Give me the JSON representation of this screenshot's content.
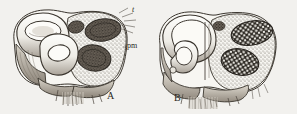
{
  "figure": {
    "type": "scientific-illustration",
    "background_color": "#f2f1ee",
    "ink_color": "#2b2722",
    "panels": [
      {
        "id": "A",
        "label": "A",
        "label_position": {
          "x": 107,
          "y": 91
        },
        "description": "left section: bilobed body, left lobe showing coiled hollow tube lumina in white, right lobe filled with fine stippled tissue containing two large dark granular oval masses"
      },
      {
        "id": "B",
        "label": "B",
        "label_position": {
          "x": 174,
          "y": 93
        },
        "description": "right section: bilobed body, left lobe showing coiled hollow tube lumina in white, right lobe filled with stippled tissue containing two large dark vacuolated (checkered) oval masses"
      }
    ],
    "callouts": [
      {
        "id": "t",
        "label": "t",
        "style": "italic",
        "position": {
          "x": 132,
          "y": 6
        },
        "points_to": "upper-right margin of panel A, radiating bristle-like leader lines"
      },
      {
        "id": "pm",
        "label": "pm",
        "style": "roman",
        "position": {
          "x": 127,
          "y": 42
        },
        "points_to": "outer membrane at right edge of panel A"
      }
    ]
  }
}
